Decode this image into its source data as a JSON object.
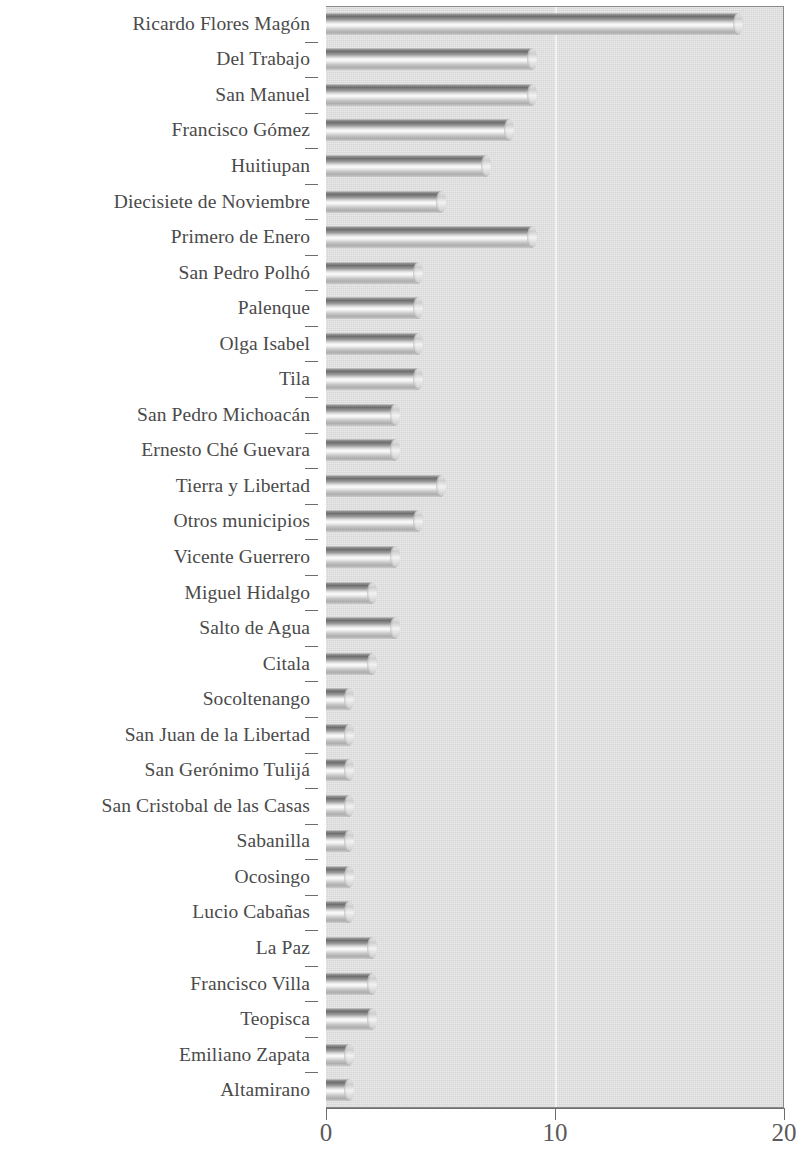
{
  "chart_data": {
    "type": "bar",
    "orientation": "horizontal",
    "title": "",
    "xlabel": "",
    "ylabel": "",
    "xlim": [
      0,
      20
    ],
    "xticks": [
      0,
      10,
      20
    ],
    "xtick_labels": [
      "0",
      "10",
      "20"
    ],
    "grid": true,
    "gridlines_x": [
      10
    ],
    "legend": null,
    "background_color": "#e3e3e3",
    "bar_style": "3d-cylinder",
    "categories": [
      "Ricardo Flores Magón",
      "Del Trabajo",
      "San Manuel",
      "Francisco Gómez",
      "Huitiupan",
      "Diecisiete de Noviembre",
      "Primero de Enero",
      "San Pedro Polhó",
      "Palenque",
      "Olga Isabel",
      "Tila",
      "San Pedro Michoacán",
      "Ernesto Ché Guevara",
      "Tierra y Libertad",
      "Otros municipios",
      "Vicente Guerrero",
      "Miguel Hidalgo",
      "Salto de Agua",
      "Citala",
      "Socoltenango",
      "San Juan de la Libertad",
      "San Gerónimo Tulijá",
      "San Cristobal de las Casas",
      "Sabanilla",
      "Ocosingo",
      "Lucio Cabañas",
      "La Paz",
      "Francisco Villa",
      "Teopisca",
      "Emiliano Zapata",
      "Altamirano"
    ],
    "values": [
      18,
      9,
      9,
      8,
      7,
      5,
      9,
      4,
      4,
      4,
      4,
      3,
      3,
      5,
      4,
      3,
      2,
      3,
      2,
      1,
      1,
      1,
      1,
      1,
      1,
      1,
      2,
      2,
      2,
      1,
      1
    ]
  }
}
